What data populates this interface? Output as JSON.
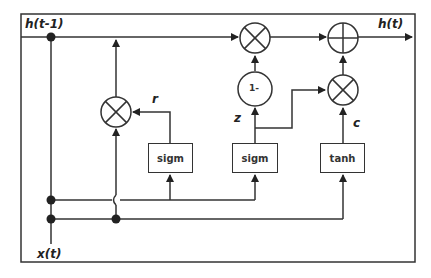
{
  "diagram": {
    "labels": {
      "h_prev": "h(t-1)",
      "h_out": "h(t)",
      "x_in": "x(t)",
      "r": "r",
      "z": "z",
      "c": "c"
    },
    "blocks": [
      {
        "id": "reset-gate",
        "label": "sigm"
      },
      {
        "id": "update-gate",
        "label": "sigm"
      },
      {
        "id": "candidate",
        "label": "tanh"
      }
    ],
    "operators": [
      {
        "id": "reset-multiply",
        "symbol": "multiply"
      },
      {
        "id": "update-multiply",
        "symbol": "multiply"
      },
      {
        "id": "one-minus",
        "symbol": "1-"
      },
      {
        "id": "candidate-multiply",
        "symbol": "multiply"
      },
      {
        "id": "sum",
        "symbol": "plus"
      }
    ],
    "colors": {
      "stroke": "#333333",
      "background": "#ffffff"
    }
  }
}
